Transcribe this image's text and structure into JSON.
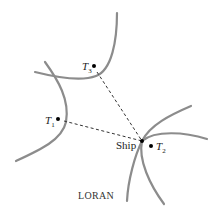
{
  "diagram": {
    "caption": "LORAN",
    "nodes": [
      {
        "id": "T1",
        "label": "T",
        "sub": "1"
      },
      {
        "id": "T2",
        "label": "T",
        "sub": "2"
      },
      {
        "id": "T3",
        "label": "T",
        "sub": "3"
      },
      {
        "id": "ship",
        "label": "Ship"
      }
    ],
    "edges": [
      {
        "from": "T1",
        "to": "ship",
        "style": "dashed"
      },
      {
        "from": "T3",
        "to": "ship",
        "style": "dashed"
      }
    ],
    "colors": {
      "curve": "#8c8c8c",
      "line": "#333333",
      "dot": "#000000"
    }
  }
}
